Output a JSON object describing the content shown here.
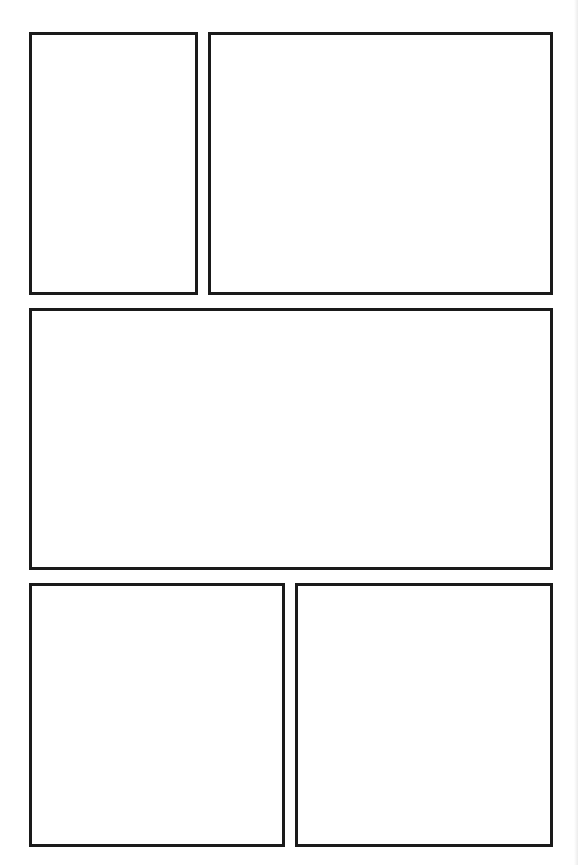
{
  "page": {
    "type": "comic-page-layout-template",
    "background": "#ffffff",
    "border_color": "#1a1a1a",
    "panel_count": 5
  },
  "panels": [
    {
      "id": 1,
      "row": 1,
      "x": 29,
      "y": 32,
      "w": 169,
      "h": 263
    },
    {
      "id": 2,
      "row": 1,
      "x": 208,
      "y": 32,
      "w": 345,
      "h": 263
    },
    {
      "id": 3,
      "row": 2,
      "x": 29,
      "y": 308,
      "w": 524,
      "h": 262
    },
    {
      "id": 4,
      "row": 3,
      "x": 29,
      "y": 583,
      "w": 256,
      "h": 264
    },
    {
      "id": 5,
      "row": 3,
      "x": 295,
      "y": 583,
      "w": 258,
      "h": 264
    }
  ]
}
